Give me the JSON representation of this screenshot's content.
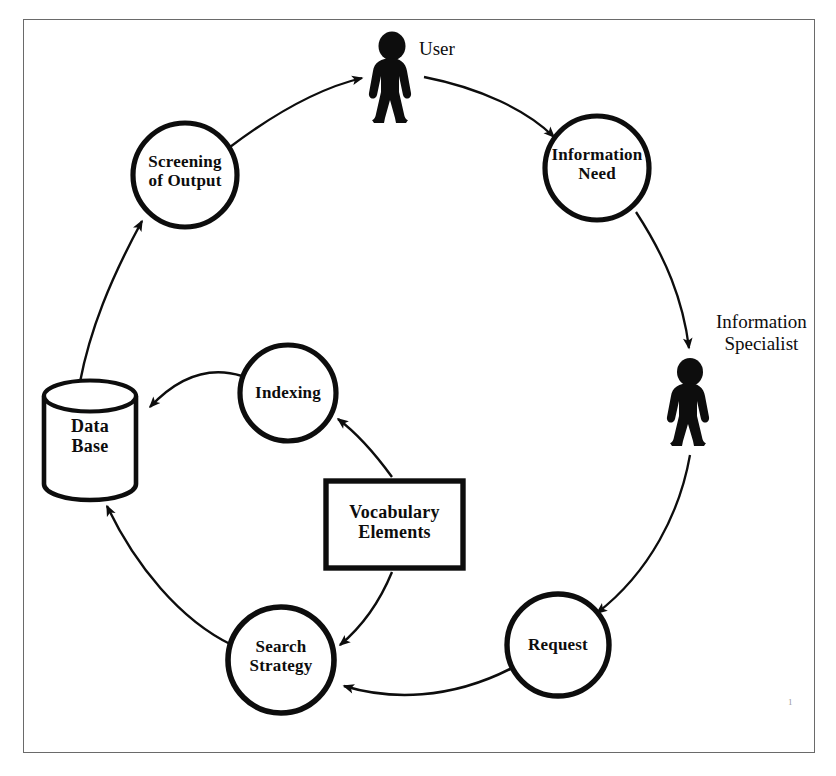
{
  "figure": {
    "border_color": "#6a6a6a",
    "ink_color": "#0d0d0d",
    "background": "#ffffff",
    "page_mark": "1"
  },
  "actors": [
    {
      "id": "user",
      "label": "User",
      "icon": "person-silhouette-icon",
      "x": 393,
      "y": 38
    },
    {
      "id": "information-specialist",
      "label": "Information\nSpecialist",
      "icon": "person-silhouette-icon",
      "x": 692,
      "y": 355
    }
  ],
  "nodes": [
    {
      "id": "screening-of-output",
      "shape": "circle",
      "label": "Screening\nof Output",
      "cx": 185,
      "cy": 175,
      "r": 52
    },
    {
      "id": "information-need",
      "shape": "circle",
      "label": "Information\nNeed",
      "cx": 597,
      "cy": 168,
      "r": 52
    },
    {
      "id": "request",
      "shape": "circle",
      "label": "Request",
      "cx": 558,
      "cy": 645,
      "r": 51
    },
    {
      "id": "search-strategy",
      "shape": "circle",
      "label": "Search\nStrategy",
      "cx": 281,
      "cy": 660,
      "r": 53
    },
    {
      "id": "indexing",
      "shape": "circle",
      "label": "Indexing",
      "cx": 288,
      "cy": 393,
      "r": 48
    },
    {
      "id": "data-base",
      "shape": "cylinder",
      "label": "Data\nBase",
      "cx": 90,
      "cy": 440,
      "width": 92,
      "height": 114
    },
    {
      "id": "vocabulary-elements",
      "shape": "rectangle",
      "label": "Vocabulary\nElements",
      "x": 326,
      "y": 481,
      "width": 137,
      "height": 87
    }
  ],
  "edges": [
    {
      "id": "screening-to-user",
      "from": "screening-of-output",
      "to": "user",
      "arrow": "to"
    },
    {
      "id": "user-to-information-need",
      "from": "user",
      "to": "information-need",
      "arrow": "to"
    },
    {
      "id": "information-need-to-specialist",
      "from": "information-need",
      "to": "information-specialist",
      "arrow": "to"
    },
    {
      "id": "specialist-to-request",
      "from": "information-specialist",
      "to": "request",
      "arrow": "to"
    },
    {
      "id": "request-to-search-strategy",
      "from": "request",
      "to": "search-strategy",
      "arrow": "to"
    },
    {
      "id": "vocabulary-to-search-strategy",
      "from": "vocabulary-elements",
      "to": "search-strategy",
      "arrow": "to"
    },
    {
      "id": "vocabulary-to-indexing",
      "from": "vocabulary-elements",
      "to": "indexing",
      "arrow": "to"
    },
    {
      "id": "indexing-to-data-base",
      "from": "indexing",
      "to": "data-base",
      "arrow": "to"
    },
    {
      "id": "search-strategy-to-data-base",
      "from": "search-strategy",
      "to": "data-base",
      "arrow": "to"
    },
    {
      "id": "data-base-to-screening",
      "from": "data-base",
      "to": "screening-of-output",
      "arrow": "to"
    }
  ]
}
